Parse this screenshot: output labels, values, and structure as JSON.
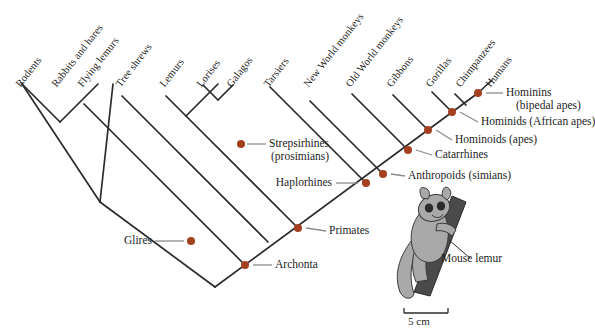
{
  "figure": {
    "type": "cladogram",
    "title": "",
    "colors": {
      "branch": "#2b2b2b",
      "node_dot": "#a4401f",
      "leader_line": "#8c8c8c",
      "text": "#1d1d1d",
      "illustration_body": "#a9a9a9",
      "illustration_branch": "#4a4a4a",
      "background": "#ffffff"
    },
    "tips": [
      {
        "id": "rodents",
        "label": "Rodents",
        "x": 22,
        "y": 82
      },
      {
        "id": "rabbits-and-hares",
        "label": "Rabbits and hares",
        "x": 58,
        "y": 82
      },
      {
        "id": "flying-lemurs",
        "label": "Flying lemurs",
        "x": 84,
        "y": 82
      },
      {
        "id": "tree-shrews",
        "label": "Tree shrews",
        "x": 122,
        "y": 82
      },
      {
        "id": "lemurs",
        "label": "Lemurs",
        "x": 166,
        "y": 82
      },
      {
        "id": "lorises",
        "label": "Lorises",
        "x": 203,
        "y": 82
      },
      {
        "id": "galagos",
        "label": "Galagos",
        "x": 233,
        "y": 82
      },
      {
        "id": "tarsiers",
        "label": "Tarsiers",
        "x": 270,
        "y": 82
      },
      {
        "id": "new-world-monkeys",
        "label": "New World monkeys",
        "x": 310,
        "y": 82
      },
      {
        "id": "old-world-monkeys",
        "label": "Old World monkeys",
        "x": 352,
        "y": 82
      },
      {
        "id": "gibbons",
        "label": "Gibbons",
        "x": 393,
        "y": 82
      },
      {
        "id": "gorillas",
        "label": "Gorillas",
        "x": 432,
        "y": 82
      },
      {
        "id": "chimpanzees",
        "label": "Chimpanzees",
        "x": 462,
        "y": 82
      },
      {
        "id": "humans",
        "label": "Humans",
        "x": 492,
        "y": 82
      }
    ],
    "clade_labels": [
      {
        "id": "hominins",
        "line1": "Hominins",
        "line2": "(bipedal apes)",
        "side": "right"
      },
      {
        "id": "hominids",
        "line1": "Hominids (African apes)",
        "line2": "",
        "side": "right"
      },
      {
        "id": "hominoids",
        "line1": "Hominoids (apes)",
        "line2": "",
        "side": "right"
      },
      {
        "id": "catarrhines",
        "line1": "Catarrhines",
        "line2": "",
        "side": "right"
      },
      {
        "id": "anthropoids",
        "line1": "Anthropoids (simians)",
        "line2": "",
        "side": "right"
      },
      {
        "id": "strepsirhines",
        "line1": "Strepsirhines",
        "line2": "(prosimians)",
        "side": "right"
      },
      {
        "id": "haplorhines",
        "line1": "Haplorhines",
        "line2": "",
        "side": "left"
      },
      {
        "id": "primates",
        "line1": "Primates",
        "line2": "",
        "side": "right"
      },
      {
        "id": "archonta",
        "line1": "Archonta",
        "line2": "",
        "side": "right"
      },
      {
        "id": "glires",
        "line1": "Glires",
        "line2": "",
        "side": "left"
      }
    ],
    "illustration": {
      "caption": "Mouse lemur",
      "scale_label": "5 cm"
    }
  }
}
